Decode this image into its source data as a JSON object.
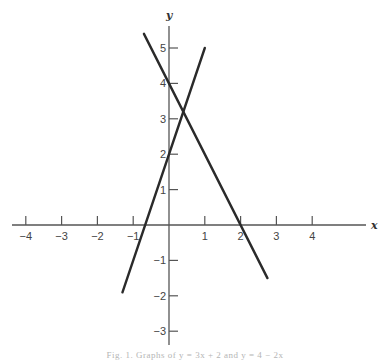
{
  "chart_data": {
    "type": "line",
    "title": "",
    "caption": "Fig. 1. Graphs of y = 3x + 2 and y = 4 − 2x",
    "xlabel": "x",
    "ylabel": "y",
    "xlim": [
      -4.3,
      5.4
    ],
    "ylim": [
      -3.3,
      5.6
    ],
    "grid": false,
    "legend": null,
    "x_ticks": [
      -4,
      -3,
      -2,
      -1,
      1,
      2,
      3,
      4
    ],
    "x_tick_labels": [
      "−4",
      "−3",
      "−2",
      "−1",
      "1",
      "2",
      "3",
      "4"
    ],
    "y_ticks": [
      5,
      4,
      3,
      2,
      1,
      -1,
      -2,
      -3
    ],
    "y_tick_labels": [
      "5",
      "4",
      "3",
      "2",
      "1",
      "−1",
      "−2",
      "−3"
    ],
    "series": [
      {
        "name": "y = 3x + 2",
        "x": [
          -1.3,
          1.0
        ],
        "y": [
          -1.9,
          5.0
        ],
        "color": "#2a2a2a"
      },
      {
        "name": "y = 4 − 2x",
        "x": [
          -0.7,
          2.75
        ],
        "y": [
          5.4,
          -1.5
        ],
        "color": "#2a2a2a"
      }
    ],
    "intersection": {
      "x": 0.4,
      "y": 3.2
    }
  }
}
